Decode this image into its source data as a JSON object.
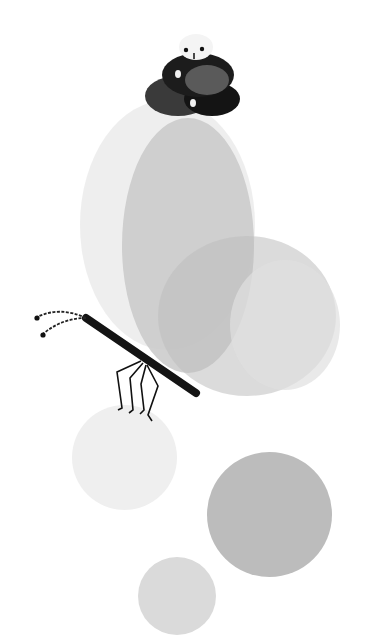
{
  "scene": {
    "title": "Ink illustration: snail on wings with insect and dots",
    "background": "#ffffff",
    "elements": [
      {
        "name": "snail",
        "icon": "snail-icon",
        "color": "#1a1a1a",
        "accent": "#555555"
      },
      {
        "name": "wing-outer",
        "color": "#ececec"
      },
      {
        "name": "wing-main",
        "color": "#c9c9c9"
      },
      {
        "name": "wing-lower",
        "color": "#bdbdbd"
      },
      {
        "name": "insect",
        "icon": "stick-insect-icon",
        "color": "#111111"
      },
      {
        "name": "ball-light",
        "color": "#efefef"
      },
      {
        "name": "ball-dark",
        "color": "#bcbcbc"
      },
      {
        "name": "ball-bottom",
        "color": "#dadada"
      }
    ]
  }
}
